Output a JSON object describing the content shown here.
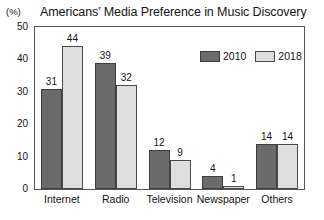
{
  "chart_data": {
    "type": "bar",
    "title": "Americans’ Media Preference in Music Discovery",
    "unit_label": "(%)",
    "xlabel": "",
    "ylabel": "",
    "ylim": [
      0,
      50
    ],
    "y_ticks": [
      0,
      10,
      20,
      30,
      40,
      50
    ],
    "y_tick_labels": [
      "0",
      "10",
      "20",
      "30",
      "40",
      "50"
    ],
    "y_minor_tick_step": 5,
    "grid": false,
    "legend_position": "top-right-inside",
    "categories": [
      "Internet",
      "Radio",
      "Television",
      "Newspaper",
      "Others"
    ],
    "series": [
      {
        "name": "2010",
        "color": "#6b6b6b",
        "values": [
          31,
          39,
          12,
          4,
          14
        ]
      },
      {
        "name": "2018",
        "color": "#dedede",
        "values": [
          44,
          32,
          9,
          1,
          14
        ]
      }
    ],
    "value_labels": {
      "2010": [
        "31",
        "39",
        "12",
        "4",
        "14"
      ],
      "2018": [
        "44",
        "32",
        "9",
        "1",
        "14"
      ]
    }
  }
}
